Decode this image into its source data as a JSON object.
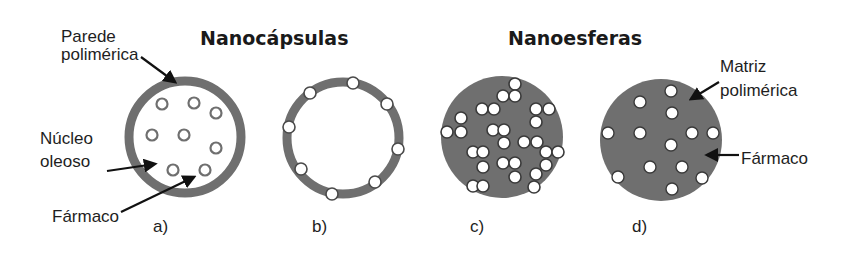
{
  "colors": {
    "background": "#ffffff",
    "polymer": "#6f6f6f",
    "text": "#1a1a1a",
    "drug_fill": "#ffffff",
    "drug_stroke": "#5a5a5a",
    "arrow": "#111111"
  },
  "titles": {
    "nanocapsulas": "Nanocápsulas",
    "nanoesferas": "Nanoesferas"
  },
  "annotations": {
    "parede_line1": "Parede",
    "parede_line2": "polimérica",
    "nucleo_line1": "Núcleo",
    "nucleo_line2": "oleoso",
    "farmaco_left": "Fármaco",
    "matriz_line1": "Matriz",
    "matriz_line2": "polimérica",
    "farmaco_right": "Fármaco"
  },
  "panels": [
    {
      "id": "a",
      "label": "a)",
      "group": "Nanocápsulas",
      "type": "capsule-drug-in-core",
      "center": [
        185,
        137
      ],
      "radius": 56,
      "wall_width": 9,
      "drugs": [
        [
          162,
          104
        ],
        [
          194,
          103
        ],
        [
          216,
          113
        ],
        [
          152,
          135
        ],
        [
          184,
          135
        ],
        [
          216,
          148
        ],
        [
          173,
          170
        ],
        [
          205,
          170
        ]
      ]
    },
    {
      "id": "b",
      "label": "b)",
      "group": "Nanocápsulas",
      "type": "capsule-drug-in-wall",
      "center": [
        343,
        138
      ],
      "radius": 56,
      "wall_width": 9,
      "drugs": [
        [
          353,
          83
        ],
        [
          310,
          93
        ],
        [
          387,
          104
        ],
        [
          289,
          127
        ],
        [
          398,
          149
        ],
        [
          301,
          169
        ],
        [
          375,
          182
        ],
        [
          332,
          194
        ]
      ]
    },
    {
      "id": "c",
      "label": "c)",
      "group": "Nanoesferas",
      "type": "sphere-dense-drug",
      "center": [
        502,
        137
      ],
      "radius": 61,
      "drugs": [
        [
          515,
          84
        ],
        [
          503,
          96
        ],
        [
          515,
          96
        ],
        [
          482,
          109
        ],
        [
          494,
          109
        ],
        [
          536,
          109
        ],
        [
          549,
          109
        ],
        [
          461,
          118
        ],
        [
          536,
          122
        ],
        [
          447,
          132
        ],
        [
          461,
          132
        ],
        [
          493,
          130
        ],
        [
          504,
          130
        ],
        [
          504,
          143
        ],
        [
          524,
          142
        ],
        [
          537,
          142
        ],
        [
          473,
          152
        ],
        [
          483,
          152
        ],
        [
          546,
          152
        ],
        [
          558,
          152
        ],
        [
          483,
          167
        ],
        [
          503,
          163
        ],
        [
          515,
          163
        ],
        [
          546,
          165
        ],
        [
          515,
          177
        ],
        [
          536,
          174
        ],
        [
          473,
          186
        ],
        [
          483,
          186
        ],
        [
          534,
          187
        ]
      ]
    },
    {
      "id": "d",
      "label": "d)",
      "group": "Nanoesferas",
      "type": "sphere-dispersed-drug",
      "center": [
        661,
        140
      ],
      "radius": 61,
      "drugs": [
        [
          671,
          91
        ],
        [
          640,
          102
        ],
        [
          672,
          113
        ],
        [
          608,
          133
        ],
        [
          640,
          133
        ],
        [
          692,
          133
        ],
        [
          713,
          133
        ],
        [
          671,
          145
        ],
        [
          650,
          167
        ],
        [
          682,
          167
        ],
        [
          618,
          177
        ],
        [
          702,
          178
        ],
        [
          672,
          189
        ]
      ]
    }
  ]
}
